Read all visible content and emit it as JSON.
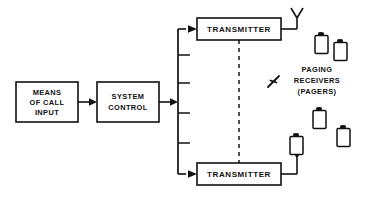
{
  "diagram": {
    "canvas": {
      "width": 365,
      "height": 200
    },
    "colors": {
      "line": "#111111",
      "background": "#ffffff",
      "box_fill": "#ffffff"
    },
    "blocks": [
      {
        "id": "means-of-call-input",
        "name": "means-of-call-input-block",
        "lines": [
          "MEANS",
          "OF CALL",
          "INPUT"
        ],
        "x": 16,
        "y": 82,
        "width": 62,
        "height": 40
      },
      {
        "id": "system-control",
        "name": "system-control-block",
        "lines": [
          "SYSTEM",
          "CONTROL"
        ],
        "x": 97,
        "y": 82,
        "width": 62,
        "height": 40
      },
      {
        "id": "transmitter-top",
        "name": "transmitter-top-block",
        "lines": [
          "TRANSMITTER"
        ],
        "x": 197,
        "y": 18,
        "width": 84,
        "height": 22
      },
      {
        "id": "transmitter-bottom",
        "name": "transmitter-bottom-block",
        "lines": [
          "TRANSMITTER"
        ],
        "x": 197,
        "y": 163,
        "width": 84,
        "height": 22
      }
    ],
    "annotations": [
      {
        "id": "paging-receivers",
        "lines": [
          "PAGING",
          "RECEIVERS",
          "(PAGERS)"
        ],
        "x": 315,
        "y": 70
      }
    ],
    "antennas": [
      {
        "id": "antenna-top",
        "name": "antenna-top",
        "x": 297,
        "y": 10
      },
      {
        "id": "antenna-bottom",
        "name": "antenna-bottom",
        "x": 297,
        "y": 148
      }
    ],
    "pagers": [
      {
        "id": "pager-1",
        "x": 315,
        "y": 35,
        "width": 13,
        "height": 18
      },
      {
        "id": "pager-2",
        "x": 334,
        "y": 42,
        "width": 13,
        "height": 18
      },
      {
        "id": "pager-3",
        "x": 313,
        "y": 110,
        "width": 13,
        "height": 18
      },
      {
        "id": "pager-4",
        "x": 337,
        "y": 128,
        "width": 13,
        "height": 18
      },
      {
        "id": "pager-5",
        "x": 290,
        "y": 136,
        "width": 13,
        "height": 18
      }
    ],
    "radio_wave": {
      "id": "radio-wave-symbol",
      "x": 268,
      "y": 76
    },
    "bus": {
      "x": 178,
      "top_y": 29,
      "bottom_y": 174,
      "stub_length": 12,
      "stub_ys": [
        55,
        83,
        113,
        143
      ]
    },
    "connections": [
      {
        "id": "input-to-control",
        "from": "means-of-call-input",
        "to": "system-control"
      },
      {
        "id": "control-to-bus",
        "from": "system-control",
        "to": "bus"
      },
      {
        "id": "bus-to-transmitter-top",
        "from": "bus",
        "to": "transmitter-top"
      },
      {
        "id": "bus-to-transmitter-bottom",
        "from": "bus",
        "to": "transmitter-bottom"
      },
      {
        "id": "transmitter-link-dashed",
        "from": "transmitter-top",
        "to": "transmitter-bottom",
        "style": "dashed"
      }
    ]
  }
}
